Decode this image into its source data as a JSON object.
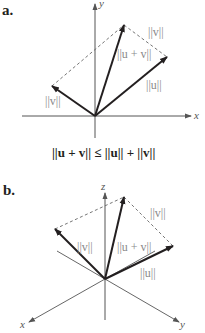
{
  "figure_a": {
    "label": "a.",
    "axes": {
      "x": "x",
      "y": "y"
    },
    "vectors": {
      "u": {
        "label": "||u||"
      },
      "v": {
        "label": "||v||"
      },
      "u_plus_v": {
        "label": "||u + v||"
      },
      "v_translated": {
        "label": "||v||"
      }
    },
    "caption": "||u + v|| ≤ ||u|| + ||v||"
  },
  "figure_b": {
    "label": "b.",
    "axes": {
      "x": "x",
      "y": "y",
      "z": "z"
    },
    "vectors": {
      "u": {
        "label": "||u||"
      },
      "v": {
        "label": "||v||"
      },
      "u_plus_v": {
        "label": "||u + v||"
      },
      "v_translated": {
        "label": "||v||"
      }
    }
  },
  "colors": {
    "vector": "#231f20",
    "axis": "#555555",
    "dashed": "#666666",
    "norm_label": "#8a8a8a"
  }
}
